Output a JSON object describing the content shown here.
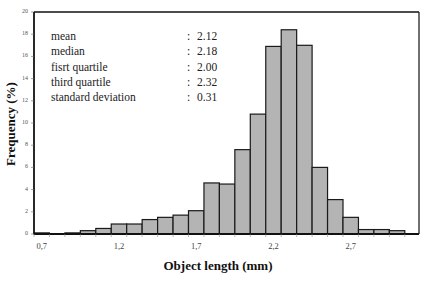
{
  "chart_data": {
    "type": "bar",
    "title": "",
    "xlabel": "Object length  (mm)",
    "ylabel": "Frequency (%)",
    "ylim": [
      0,
      20
    ],
    "y_ticks": [
      "0",
      "2",
      "4",
      "6",
      "8",
      "10",
      "12",
      "14",
      "16",
      "18",
      "20"
    ],
    "x_tick_labels": [
      "0,7",
      "1,2",
      "1,7",
      "2,2",
      "2,7"
    ],
    "categories": [
      0.7,
      0.8,
      0.9,
      1.0,
      1.1,
      1.2,
      1.3,
      1.4,
      1.5,
      1.6,
      1.7,
      1.8,
      1.9,
      2.0,
      2.1,
      2.2,
      2.3,
      2.4,
      2.5,
      2.6,
      2.7,
      2.8,
      2.9,
      3.0
    ],
    "values": [
      0.1,
      0.0,
      0.1,
      0.3,
      0.5,
      0.9,
      0.9,
      1.3,
      1.5,
      1.7,
      2.1,
      4.6,
      4.5,
      7.6,
      10.8,
      16.9,
      18.4,
      17.0,
      6.0,
      3.1,
      1.5,
      0.4,
      0.4,
      0.3
    ],
    "bar_color": "#b4b4b4",
    "edge_color": "#1a1a1a",
    "grid": false,
    "legend": null,
    "annotation": [
      {
        "label": "mean",
        "value": "2.12"
      },
      {
        "label": "median",
        "value": "2.18"
      },
      {
        "label": "fisrt quartile",
        "value": "2.00"
      },
      {
        "label": "third quartile",
        "value": "2.32"
      },
      {
        "label": "standard deviation",
        "value": "0.31"
      }
    ]
  }
}
